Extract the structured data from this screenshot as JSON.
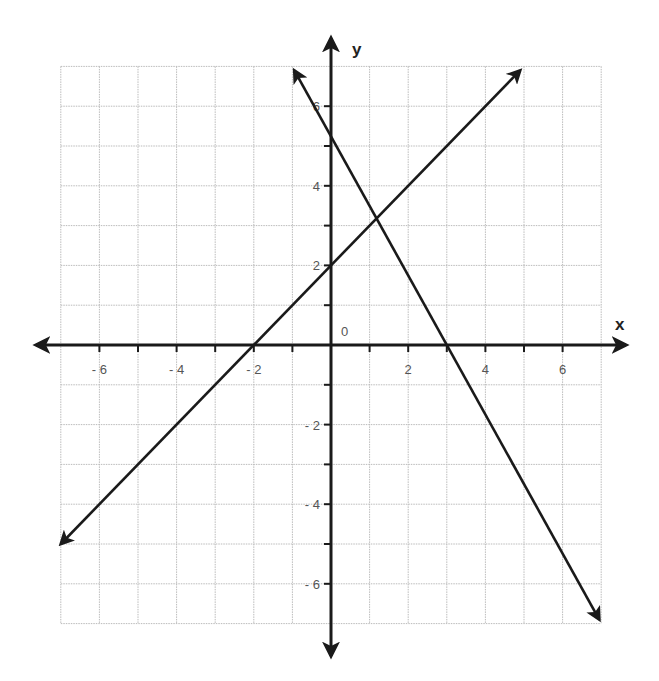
{
  "chart_data": {
    "type": "line",
    "title": "",
    "xlabel": "x",
    "ylabel": "y",
    "xlim": [
      -7,
      7
    ],
    "ylim": [
      -7,
      7
    ],
    "grid": true,
    "x_ticks": [
      -6,
      -4,
      -2,
      2,
      4,
      6
    ],
    "y_ticks": [
      -6,
      -4,
      -2,
      2,
      4,
      6
    ],
    "x_tick_labels": [
      "- 6",
      "- 4",
      "- 2",
      "2",
      "4",
      "6"
    ],
    "y_tick_labels": [
      "- 6",
      "- 4",
      "- 2",
      "2",
      "4",
      "6"
    ],
    "origin_label": "0",
    "series": [
      {
        "name": "line-1",
        "equation": "y = x + 2",
        "slope": 1,
        "intercept": 2,
        "x": [
          -7,
          4.9
        ],
        "y": [
          -5,
          6.9
        ],
        "x_intercept": -2,
        "y_intercept": 2
      },
      {
        "name": "line-2",
        "equation": "y = -1.75x + 5.25",
        "slope": -1.75,
        "intercept": 5.25,
        "x": [
          -0.95,
          6.95
        ],
        "y": [
          6.9,
          -6.9
        ],
        "x_intercept": 3,
        "y_intercept": 5.25
      }
    ],
    "annotations": [
      {
        "type": "intersection",
        "x": 1.18,
        "y": 3.18
      }
    ]
  },
  "colors": {
    "axis": "#1a1a1a",
    "line": "#1a1a1a",
    "grid": "#bbbbbb",
    "label": "#555555"
  }
}
